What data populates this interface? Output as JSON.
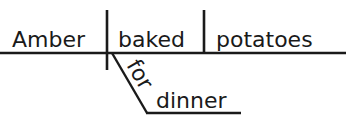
{
  "diagram": {
    "type": "reed-kellogg-sentence-diagram",
    "sentence": "Amber baked potatoes for dinner",
    "ink_color": "#1a1a1a",
    "background_color": "#ffffff",
    "words": {
      "subject": "Amber",
      "verb": "baked",
      "direct_object": "potatoes",
      "preposition": "for",
      "object_of_preposition": "dinner"
    },
    "parts": {
      "subject_label": "subject",
      "verb_label": "verb",
      "direct_object_label": "direct object",
      "preposition_label": "preposition",
      "object_of_preposition_label": "object of preposition"
    },
    "lines": {
      "main_baseline": "main horizontal baseline",
      "subject_verb_divider": "vertical line crossing baseline",
      "verb_object_divider": "vertical line stopping at baseline",
      "prepositional_slant": "diagonal line for preposition",
      "prepositional_baseline": "horizontal line for object of preposition"
    }
  }
}
